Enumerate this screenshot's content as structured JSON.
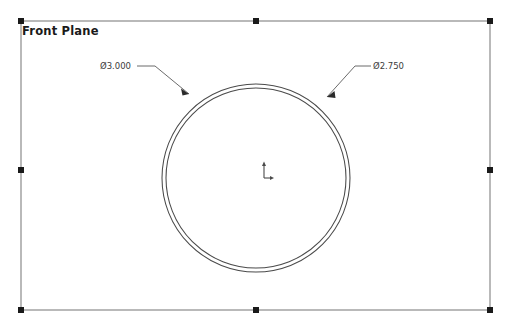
{
  "viewport": {
    "width": 514,
    "height": 331,
    "background": "#ffffff"
  },
  "plane": {
    "label": "Front Plane",
    "border_color": "#808080",
    "handle_color": "#1a1a1a",
    "rect": {
      "x": 21,
      "y": 21,
      "width": 469,
      "height": 289
    },
    "handles": [
      {
        "name": "handle-top-left",
        "x": 21,
        "y": 21
      },
      {
        "name": "handle-top-center",
        "x": 256,
        "y": 21
      },
      {
        "name": "handle-top-right",
        "x": 490,
        "y": 21
      },
      {
        "name": "handle-middle-left",
        "x": 21,
        "y": 170
      },
      {
        "name": "handle-middle-right",
        "x": 490,
        "y": 170
      },
      {
        "name": "handle-bottom-left",
        "x": 21,
        "y": 310
      },
      {
        "name": "handle-bottom-center",
        "x": 256,
        "y": 310
      },
      {
        "name": "handle-bottom-right",
        "x": 490,
        "y": 310
      }
    ]
  },
  "sketch": {
    "geometry_color": "#4a4a4a",
    "center": {
      "x": 256,
      "y": 178
    },
    "circles": [
      {
        "name": "outer-circle",
        "radius": 94,
        "diameter_label": "Ø3.000"
      },
      {
        "name": "inner-circle",
        "radius": 90,
        "diameter_label": "Ø2.750"
      }
    ]
  },
  "dimensions": [
    {
      "id": "dim-outer",
      "name": "diameter-dimension-outer",
      "text": "Ø3.000",
      "value": 3.0,
      "symbol": "Ø",
      "target": "outer-circle",
      "label_pos": {
        "x": 100,
        "y": 61
      },
      "leader": {
        "shoulder_start": {
          "x": 137,
          "y": 66
        },
        "shoulder_end": {
          "x": 155,
          "y": 66
        },
        "arrow_tip": {
          "x": 189,
          "y": 94
        }
      }
    },
    {
      "id": "dim-inner",
      "name": "diameter-dimension-inner",
      "text": "Ø2.750",
      "value": 2.75,
      "symbol": "Ø",
      "target": "inner-circle",
      "label_pos": {
        "x": 373,
        "y": 61
      },
      "leader": {
        "shoulder_start": {
          "x": 371,
          "y": 66
        },
        "shoulder_end": {
          "x": 355,
          "y": 66
        },
        "arrow_tip": {
          "x": 327,
          "y": 97
        }
      }
    }
  ],
  "origin": {
    "name": "origin-marker",
    "x": 264,
    "y": 178,
    "color": "#4a4a4a",
    "axis_length": 14
  }
}
